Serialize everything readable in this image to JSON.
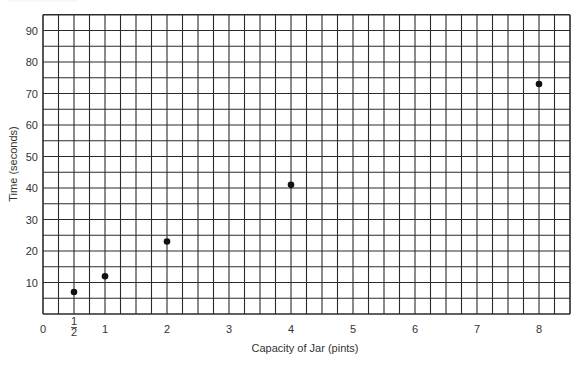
{
  "chart_data": {
    "type": "scatter",
    "title": "",
    "xlabel": "Capacity of Jar (pints)",
    "ylabel": "Time (seconds)",
    "x_tick_labels": [
      "0",
      "1/2",
      "1",
      "2",
      "3",
      "4",
      "5",
      "6",
      "7",
      "8"
    ],
    "x_tick_values": [
      0,
      0.5,
      1,
      2,
      3,
      4,
      5,
      6,
      7,
      8
    ],
    "y_tick_labels": [
      "10",
      "20",
      "30",
      "40",
      "50",
      "60",
      "70",
      "80",
      "90"
    ],
    "y_tick_values": [
      10,
      20,
      30,
      40,
      50,
      60,
      70,
      80,
      90
    ],
    "xlim": [
      0,
      8.5
    ],
    "ylim": [
      0,
      95
    ],
    "grid": true,
    "grid_minor_x": 0.25,
    "grid_minor_y": 5,
    "legend": null,
    "series": [
      {
        "name": "Time to fill jar",
        "points": [
          {
            "x": 0.5,
            "y": 7
          },
          {
            "x": 1,
            "y": 12
          },
          {
            "x": 2,
            "y": 23
          },
          {
            "x": 4,
            "y": 41
          },
          {
            "x": 8,
            "y": 73
          }
        ]
      }
    ]
  },
  "style": {
    "grid_color": "#2b2b2b",
    "point_color": "#111111",
    "text_color": "#333333"
  }
}
